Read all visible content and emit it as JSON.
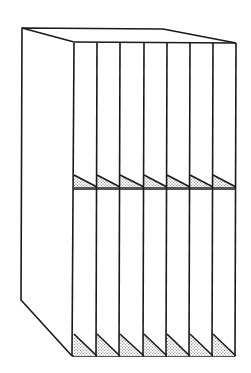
{
  "diagram": {
    "stroke_color": "#1a1a1a",
    "background": "#ffffff",
    "shade_color": "#9a9a9a",
    "compartments_per_row": 7,
    "rows": 2,
    "outline": {
      "back_top_left": [
        22,
        28
      ],
      "back_top_mid": [
        163,
        29
      ],
      "front_top_left": [
        74,
        42
      ],
      "front_top_right": [
        236,
        43
      ],
      "left_bottom": [
        21,
        300
      ],
      "front_bottom_left": [
        72,
        356
      ],
      "front_bottom_right": [
        235,
        356
      ]
    },
    "dividers_x": [
      74,
      97,
      120,
      144,
      167,
      190,
      213,
      236
    ],
    "shelf_y": 187,
    "top_y": 43,
    "bottom_y": 356
  }
}
